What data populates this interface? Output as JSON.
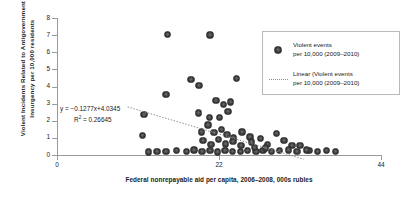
{
  "chart_data": {
    "type": "scatter",
    "title": "",
    "xlabel": "Federal nonrepayable aid per capita, 2006–2008, 000s rubles",
    "ylabel": "Violent Incidents Related to Antigovernment Insurgency per 10,000 residents",
    "ylabel_line1": "Violent Incidents Related to Antigovernment",
    "ylabel_line2": "Insurgency per 10,000 residents",
    "xlim": [
      0,
      44
    ],
    "ylim": [
      0,
      8
    ],
    "xticks": [
      0,
      22,
      44
    ],
    "xtick_labels": [
      "0",
      "22",
      "44"
    ],
    "yticks": [
      0,
      1,
      2,
      3,
      4,
      5,
      6,
      7,
      8
    ],
    "ytick_labels": [
      "0",
      "1",
      "2",
      "3",
      "4",
      "5",
      "6",
      "7",
      "8"
    ],
    "grid": false,
    "legend_position": "top-right",
    "marker_color": "#3d3d3d",
    "trendline_color": "#8c8c8c",
    "axis_color": "#9a9a9a",
    "series": [
      {
        "name": "Violent events per 10,000 (2009–2010)",
        "type": "scatter",
        "points": [
          [
            15.0,
            7.05
          ],
          [
            20.8,
            7.0
          ],
          [
            18.2,
            4.4
          ],
          [
            19.3,
            4.05
          ],
          [
            24.4,
            4.45
          ],
          [
            14.8,
            3.55
          ],
          [
            21.6,
            3.2
          ],
          [
            22.6,
            2.95
          ],
          [
            23.6,
            3.1
          ],
          [
            11.8,
            2.35
          ],
          [
            19.2,
            2.45
          ],
          [
            20.7,
            2.2
          ],
          [
            22.1,
            2.2
          ],
          [
            23.2,
            2.55
          ],
          [
            20.5,
            1.75
          ],
          [
            19.6,
            1.35
          ],
          [
            21.3,
            1.3
          ],
          [
            22.3,
            1.5
          ],
          [
            23.1,
            1.2
          ],
          [
            11.6,
            1.15
          ],
          [
            24.0,
            1.0
          ],
          [
            25.1,
            1.35
          ],
          [
            26.2,
            1.05
          ],
          [
            19.8,
            0.85
          ],
          [
            20.9,
            0.6
          ],
          [
            21.9,
            0.9
          ],
          [
            22.9,
            0.65
          ],
          [
            23.9,
            0.8
          ],
          [
            25.0,
            0.55
          ],
          [
            26.4,
            0.75
          ],
          [
            27.6,
            0.95
          ],
          [
            28.6,
            0.6
          ],
          [
            29.8,
            1.25
          ],
          [
            30.8,
            0.85
          ],
          [
            31.9,
            0.55
          ],
          [
            16.2,
            0.25
          ],
          [
            17.6,
            0.2
          ],
          [
            18.6,
            0.3
          ],
          [
            19.7,
            0.2
          ],
          [
            20.8,
            0.25
          ],
          [
            21.8,
            0.18
          ],
          [
            22.8,
            0.25
          ],
          [
            23.8,
            0.2
          ],
          [
            24.9,
            0.22
          ],
          [
            25.9,
            0.25
          ],
          [
            27.0,
            0.2
          ],
          [
            28.0,
            0.28
          ],
          [
            29.1,
            0.2
          ],
          [
            30.2,
            0.25
          ],
          [
            31.4,
            0.3
          ],
          [
            32.6,
            0.2
          ],
          [
            34.2,
            0.25
          ],
          [
            35.4,
            0.2
          ],
          [
            36.6,
            0.25
          ],
          [
            37.8,
            0.22
          ],
          [
            33.0,
            0.55
          ],
          [
            33.9,
            0.3
          ],
          [
            12.4,
            0.18
          ],
          [
            13.6,
            0.2
          ],
          [
            14.8,
            0.22
          ],
          [
            26.8,
            0.45
          ],
          [
            28.3,
            0.4
          ]
        ]
      },
      {
        "name": "Linear (Violent events per 10,000 (2009–2010)",
        "type": "line",
        "style": "dotted",
        "equation": "y = −0.1277x+4.0345",
        "slope": -0.1277,
        "intercept": 4.0345,
        "r_squared": 0.26645,
        "x_range": [
          9.6,
          33.5
        ]
      }
    ],
    "annotations": {
      "equation_line1": "y =  −0.1277x+4.0345",
      "equation_line2_prefix": "R",
      "equation_line2_sup": "2",
      "equation_line2_rest": " = 0.26645"
    },
    "legend": [
      {
        "key": "marker",
        "line1": "Violent events",
        "line2": "per 10,000 (2009–2010)"
      },
      {
        "key": "dotted-line",
        "line1": "Linear (Violent events",
        "line2": "per 10,000 (2009–2010)"
      }
    ]
  }
}
